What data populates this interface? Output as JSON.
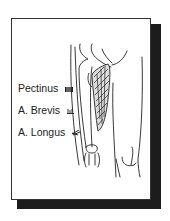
{
  "figure": {
    "legend": [
      {
        "label": "Pectinus",
        "icon": "pectinus-swatch-icon"
      },
      {
        "label": "A. Brevis",
        "icon": "adductor-brevis-swatch-icon"
      },
      {
        "label": "A. Longus",
        "icon": "adductor-longus-swatch-icon"
      }
    ],
    "colors": {
      "line": "#222222",
      "shadow": "#1c1c1c",
      "background": "#ffffff"
    }
  }
}
